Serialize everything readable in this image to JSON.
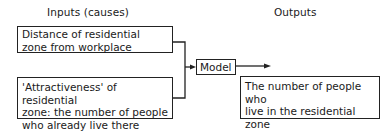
{
  "headings": {
    "inputs": "Inputs (causes)",
    "outputs": "Outputs"
  },
  "inputs": [
    {
      "line1": "Distance of residential",
      "line2": "zone from workplace"
    },
    {
      "line1": "'Attractiveness' of residential",
      "line2": "zone: the number of people",
      "line3": "who already live there"
    }
  ],
  "model": {
    "label": "Model"
  },
  "output": {
    "line1": "The number of people who",
    "line2": "live in the residential",
    "line3": "zone"
  },
  "colors": {
    "stroke": "#222222",
    "background": "#ffffff"
  }
}
